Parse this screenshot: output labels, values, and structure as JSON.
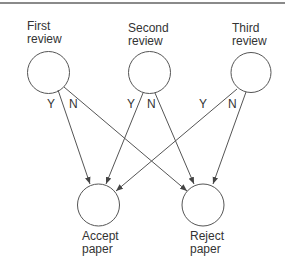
{
  "diagram": {
    "colors": {
      "stroke": "#555555",
      "text": "#333333",
      "border": "#8a8a8a"
    },
    "nodes": [
      {
        "id": "first",
        "line1": "First",
        "line2": "review",
        "cx": 48.5,
        "cy": 72.5,
        "r": 21
      },
      {
        "id": "second",
        "line1": "Second",
        "line2": "review",
        "cx": 149.5,
        "cy": 72.5,
        "r": 21
      },
      {
        "id": "third",
        "line1": "Third",
        "line2": "review",
        "cx": 251,
        "cy": 72.5,
        "r": 20
      },
      {
        "id": "accept",
        "line1": "Accept",
        "line2": "paper",
        "cx": 98.5,
        "cy": 205,
        "r": 21
      },
      {
        "id": "reject",
        "line1": "Reject",
        "line2": "paper",
        "cx": 203,
        "cy": 205,
        "r": 21
      }
    ],
    "edges": [
      {
        "from": "first",
        "to": "accept",
        "label": "Y"
      },
      {
        "from": "first",
        "to": "reject",
        "label": "N"
      },
      {
        "from": "second",
        "to": "accept",
        "label": "Y"
      },
      {
        "from": "second",
        "to": "reject",
        "label": "N"
      },
      {
        "from": "third",
        "to": "accept",
        "label": "Y"
      },
      {
        "from": "third",
        "to": "reject",
        "label": "N"
      }
    ]
  }
}
